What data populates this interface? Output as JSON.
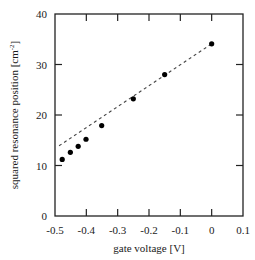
{
  "chart_data": {
    "type": "scatter",
    "title": "",
    "xlabel": "gate voltage [V]",
    "ylabel": "squared resonance position [cm",
    "ylabel_sup": "-2",
    "ylabel_tail": "]",
    "xlim": [
      -0.5,
      0.1
    ],
    "ylim": [
      0,
      40
    ],
    "xticks": [
      -0.5,
      -0.4,
      -0.3,
      -0.2,
      -0.1,
      0,
      0.1
    ],
    "xtick_labels": [
      "-0.5",
      "-0.4",
      "-0.3",
      "-0.2",
      "-0.1",
      "0",
      "0.1"
    ],
    "yticks": [
      0,
      10,
      20,
      30,
      40
    ],
    "ytick_labels": [
      "0",
      "10",
      "20",
      "30",
      "40"
    ],
    "grid": false,
    "legend": null,
    "series": [
      {
        "name": "measured",
        "style": "markers",
        "x": [
          -0.477,
          -0.451,
          -0.426,
          -0.401,
          -0.351,
          -0.25,
          -0.15,
          0.0
        ],
        "y": [
          11.2,
          12.6,
          13.8,
          15.2,
          17.9,
          23.2,
          28.0,
          34.1
        ]
      },
      {
        "name": "linear fit",
        "style": "dashed-line",
        "x": [
          -0.487,
          0.0
        ],
        "y": [
          13.9,
          34.1
        ]
      }
    ]
  },
  "colors": {
    "axes": "#222222",
    "markers": "#000000",
    "fit_line": "#444444"
  }
}
